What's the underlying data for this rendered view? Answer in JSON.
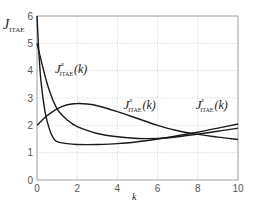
{
  "chart_data": {
    "type": "line",
    "title": "",
    "xlabel": "k",
    "ylabel": "J_ITAE",
    "xlim": [
      0,
      10
    ],
    "ylim": [
      0,
      6
    ],
    "grid": true,
    "xticks": [
      0,
      2,
      4,
      6,
      8,
      10
    ],
    "yticks": [
      0,
      1,
      2,
      3,
      4,
      5,
      6
    ],
    "series": [
      {
        "name": "J^a_ITAE(k)",
        "x": [
          0,
          0.1,
          0.2,
          0.4,
          0.6,
          0.8,
          1.0,
          1.5,
          2,
          3,
          4,
          5,
          6,
          7,
          8,
          9,
          10
        ],
        "values": [
          6.0,
          4.6,
          3.6,
          2.5,
          1.9,
          1.55,
          1.4,
          1.33,
          1.3,
          1.3,
          1.33,
          1.4,
          1.5,
          1.62,
          1.75,
          1.9,
          2.05
        ]
      },
      {
        "name": "J^e_ITAE(k)",
        "x": [
          0,
          0.3,
          0.6,
          1.0,
          1.5,
          2,
          3,
          4,
          5,
          6,
          7,
          8,
          9,
          10
        ],
        "values": [
          5.0,
          4.1,
          3.3,
          2.6,
          2.2,
          1.95,
          1.7,
          1.58,
          1.52,
          1.52,
          1.58,
          1.68,
          1.78,
          1.9
        ]
      },
      {
        "name": "J^u_ITAE(k)",
        "x": [
          0,
          0.5,
          1,
          1.5,
          2,
          2.5,
          3,
          4,
          5,
          6,
          7,
          8,
          9,
          10
        ],
        "values": [
          2.0,
          2.35,
          2.6,
          2.75,
          2.8,
          2.78,
          2.72,
          2.5,
          2.25,
          2.0,
          1.8,
          1.67,
          1.57,
          1.48
        ]
      }
    ],
    "annotations": [
      {
        "text": "J",
        "sup": "a",
        "sub": "ITAE",
        "arg": "(k)",
        "x": 0.9,
        "y": 3.9
      },
      {
        "text": "J",
        "sup": "u",
        "sub": "ITAE",
        "arg": "(k)",
        "x": 4.3,
        "y": 2.6
      },
      {
        "text": "J",
        "sup": "e",
        "sub": "ITAE",
        "arg": "(k)",
        "x": 7.9,
        "y": 2.6
      }
    ]
  },
  "labels": {
    "ylabel_main": "J",
    "ylabel_sub": "ITAE",
    "xlabel": "k"
  }
}
